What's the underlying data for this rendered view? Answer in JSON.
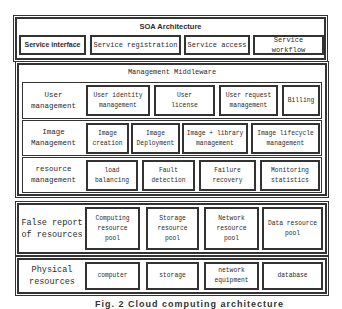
{
  "soa": {
    "title": "SOA Architecture",
    "items": [
      {
        "label": "Service interface"
      },
      {
        "label": "Service registration"
      },
      {
        "label": "Service access"
      },
      {
        "label": "Service workflow"
      }
    ]
  },
  "middleware": {
    "title": "Management Middleware",
    "rows": [
      {
        "label": "User\nmanagement",
        "items": [
          {
            "label": "User identity\nmanagement"
          },
          {
            "label": "User\nlicense"
          },
          {
            "label": "User request\nmanagement"
          },
          {
            "label": "Billing"
          }
        ]
      },
      {
        "label": "Image\nManagement",
        "items": [
          {
            "label": "Image\ncreation"
          },
          {
            "label": "Image\nDeployment"
          },
          {
            "label": "Image + library\nmanagement"
          },
          {
            "label": "Image lifecycle\nmanagement"
          }
        ]
      },
      {
        "label": "resource\nmanagement",
        "items": [
          {
            "label": "load\nbalancing"
          },
          {
            "label": "Fault\ndetection"
          },
          {
            "label": "Failure\nrecovery"
          },
          {
            "label": "Monitoring\nstatistics"
          }
        ]
      }
    ]
  },
  "virtual": {
    "label": "False report\nof resources",
    "items": [
      {
        "label": "Computing\nresource\npool"
      },
      {
        "label": "Storage\nresource\npool"
      },
      {
        "label": "Network\nresource\npool"
      },
      {
        "label": "Data resource\npool"
      }
    ]
  },
  "physical": {
    "label": "Physical\nresources",
    "items": [
      {
        "label": "computer"
      },
      {
        "label": "storage"
      },
      {
        "label": "network\nequipment"
      },
      {
        "label": "database"
      }
    ]
  },
  "caption": "Fig. 2   Cloud computing architecture"
}
